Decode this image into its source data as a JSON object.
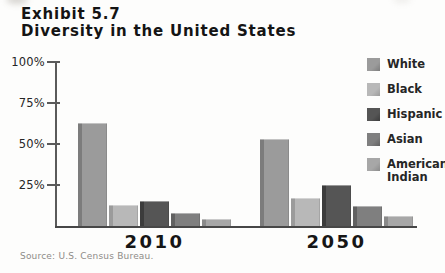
{
  "header": {
    "exhibit": "Exhibit 5.7",
    "title": "Diversity in the United States"
  },
  "chart_data": {
    "type": "bar",
    "title": "Diversity in the United States",
    "subtitle": "Exhibit 5.7",
    "categories": [
      "2010",
      "2050"
    ],
    "series": [
      {
        "name": "White",
        "values": [
          63,
          53
        ],
        "color": "#9b9b9b",
        "edge_color": "#7c7c7c"
      },
      {
        "name": "Black",
        "values": [
          13,
          17
        ],
        "color": "#b8b8b8",
        "edge_color": "#9b9b9b"
      },
      {
        "name": "Hispanic",
        "values": [
          15,
          25
        ],
        "color": "#555555",
        "edge_color": "#3c3c3c"
      },
      {
        "name": "Asian",
        "values": [
          8,
          12
        ],
        "color": "#7f7f7f",
        "edge_color": "#616161"
      },
      {
        "name": "American Indian",
        "values": [
          4,
          6
        ],
        "color": "#a7a7a7",
        "edge_color": "#8a8a8a"
      }
    ],
    "y_ticks": [
      "100%",
      "75%",
      "50%",
      "25%"
    ],
    "y_tick_values": [
      100,
      75,
      50,
      25
    ],
    "ylim": [
      0,
      100
    ],
    "xlabel": "",
    "ylabel": "",
    "grid": false,
    "legend_position": "right"
  },
  "source": {
    "text": "Source: U.S. Census Bureau."
  }
}
